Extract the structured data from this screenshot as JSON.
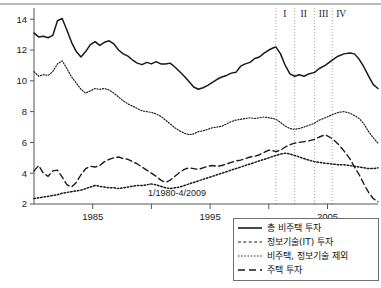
{
  "chart_data": {
    "type": "line",
    "title": "",
    "subtitle": "",
    "xlabel": "",
    "ylabel": "",
    "annotation": "1/1980-4/2009",
    "grid": false,
    "legend_position": "bottom-right",
    "xlim": [
      1980,
      2009.3
    ],
    "ylim": [
      2,
      14.6
    ],
    "x_ticks_major": [
      1985,
      1995,
      2005
    ],
    "x_ticks_minor": [
      1990,
      2000
    ],
    "x_tick_labels": [
      "1985",
      "1995",
      "2005"
    ],
    "y_ticks": [
      2,
      4,
      6,
      8,
      10,
      12,
      14
    ],
    "y_tick_labels": [
      "2",
      "4",
      "6",
      "8",
      "10",
      "12",
      "14"
    ],
    "period_markers": [
      {
        "label": "I",
        "x": 2000.6
      },
      {
        "label": "II",
        "x": 2002.2
      },
      {
        "label": "III",
        "x": 2003.9
      },
      {
        "label": "IV",
        "x": 2005.4
      }
    ],
    "series": [
      {
        "name": "총 비주택 투자",
        "style": "solid",
        "x": [
          1980.0,
          1980.4,
          1980.8,
          1981.2,
          1981.6,
          1982.0,
          1982.4,
          1982.8,
          1983.2,
          1983.6,
          1984.0,
          1984.4,
          1984.8,
          1985.2,
          1985.6,
          1986.0,
          1986.4,
          1986.8,
          1987.2,
          1987.6,
          1988.0,
          1988.4,
          1988.8,
          1989.2,
          1989.6,
          1990.0,
          1990.4,
          1990.8,
          1991.2,
          1991.6,
          1992.0,
          1992.4,
          1992.8,
          1993.2,
          1993.6,
          1994.0,
          1994.4,
          1994.8,
          1995.2,
          1995.6,
          1996.0,
          1996.4,
          1996.8,
          1997.2,
          1997.6,
          1998.0,
          1998.4,
          1998.8,
          1999.2,
          1999.6,
          2000.0,
          2000.4,
          2000.6,
          2001.0,
          2001.4,
          2001.8,
          2002.2,
          2002.6,
          2003.0,
          2003.4,
          2003.9,
          2004.3,
          2004.8,
          2005.4,
          2005.9,
          2006.4,
          2006.9,
          2007.3,
          2007.7,
          2008.1,
          2008.5,
          2008.9,
          2009.3
        ],
        "y": [
          13.1,
          12.85,
          12.9,
          12.8,
          12.95,
          13.9,
          14.05,
          13.3,
          12.5,
          11.9,
          11.55,
          11.9,
          12.35,
          12.55,
          12.3,
          12.5,
          12.6,
          12.4,
          12.0,
          11.75,
          11.6,
          11.35,
          11.15,
          11.05,
          11.2,
          11.1,
          11.25,
          11.1,
          11.1,
          11.15,
          10.9,
          10.6,
          10.3,
          9.95,
          9.6,
          9.45,
          9.55,
          9.7,
          9.9,
          10.1,
          10.25,
          10.35,
          10.5,
          10.55,
          10.95,
          11.1,
          11.2,
          11.45,
          11.55,
          11.8,
          12.0,
          12.15,
          12.2,
          11.75,
          11.0,
          10.45,
          10.3,
          10.4,
          10.3,
          10.45,
          10.55,
          10.8,
          11.0,
          11.35,
          11.6,
          11.75,
          11.8,
          11.75,
          11.4,
          10.9,
          10.3,
          9.75,
          9.5
        ]
      },
      {
        "name": "정보기술(IT) 투자",
        "style": "dotted-fine",
        "x": [
          1980.0,
          1980.4,
          1980.8,
          1981.2,
          1981.6,
          1982.0,
          1982.4,
          1982.8,
          1983.2,
          1983.6,
          1984.0,
          1984.4,
          1984.8,
          1985.2,
          1985.6,
          1986.0,
          1986.4,
          1986.8,
          1987.2,
          1987.6,
          1988.0,
          1988.4,
          1988.8,
          1989.2,
          1989.6,
          1990.0,
          1990.4,
          1990.8,
          1991.2,
          1991.6,
          1992.0,
          1992.4,
          1992.8,
          1993.2,
          1993.6,
          1994.0,
          1994.4,
          1994.8,
          1995.2,
          1995.6,
          1996.0,
          1996.4,
          1996.8,
          1997.2,
          1997.6,
          1998.0,
          1998.4,
          1998.8,
          1999.2,
          1999.6,
          2000.0,
          2000.4,
          2000.6,
          2001.0,
          2001.4,
          2001.8,
          2002.2,
          2002.6,
          2003.0,
          2003.4,
          2003.9,
          2004.3,
          2004.8,
          2005.4,
          2005.9,
          2006.4,
          2006.9,
          2007.3,
          2007.7,
          2008.1,
          2008.5,
          2008.9,
          2009.3
        ],
        "y": [
          10.6,
          10.3,
          10.4,
          10.35,
          10.6,
          11.1,
          11.3,
          10.8,
          10.25,
          9.85,
          9.45,
          9.2,
          9.35,
          9.5,
          9.45,
          9.5,
          9.4,
          9.2,
          8.95,
          8.7,
          8.5,
          8.35,
          8.2,
          8.05,
          8.0,
          7.95,
          7.85,
          7.7,
          7.45,
          7.2,
          6.95,
          6.75,
          6.6,
          6.5,
          6.55,
          6.7,
          6.75,
          6.85,
          6.95,
          7.0,
          7.05,
          7.2,
          7.35,
          7.45,
          7.5,
          7.55,
          7.6,
          7.55,
          7.6,
          7.65,
          7.6,
          7.55,
          7.5,
          7.3,
          7.05,
          6.9,
          6.85,
          6.9,
          7.0,
          7.1,
          7.25,
          7.45,
          7.6,
          7.8,
          7.95,
          8.0,
          7.9,
          7.75,
          7.55,
          7.2,
          6.7,
          6.3,
          5.95
        ]
      },
      {
        "name": "비주택, 정보기술 제외",
        "style": "dotted-bold",
        "x": [
          1980.0,
          1980.4,
          1980.8,
          1981.2,
          1981.6,
          1982.0,
          1982.4,
          1982.8,
          1983.2,
          1983.6,
          1984.0,
          1984.4,
          1984.8,
          1985.2,
          1985.6,
          1986.0,
          1986.4,
          1986.8,
          1987.2,
          1987.6,
          1988.0,
          1988.4,
          1988.8,
          1989.2,
          1989.6,
          1990.0,
          1990.4,
          1990.8,
          1991.2,
          1991.6,
          1992.0,
          1992.4,
          1992.8,
          1993.2,
          1993.6,
          1994.0,
          1994.4,
          1994.8,
          1995.2,
          1995.6,
          1996.0,
          1996.4,
          1996.8,
          1997.2,
          1997.6,
          1998.0,
          1998.4,
          1998.8,
          1999.2,
          1999.6,
          2000.0,
          2000.4,
          2000.6,
          2001.0,
          2001.4,
          2001.8,
          2002.2,
          2002.6,
          2003.0,
          2003.4,
          2003.9,
          2004.3,
          2004.8,
          2005.4,
          2005.9,
          2006.4,
          2006.9,
          2007.3,
          2007.7,
          2008.1,
          2008.5,
          2008.9,
          2009.3
        ],
        "y": [
          2.35,
          2.4,
          2.45,
          2.5,
          2.55,
          2.6,
          2.7,
          2.75,
          2.8,
          2.85,
          2.9,
          3.0,
          3.1,
          3.2,
          3.15,
          3.1,
          3.05,
          3.05,
          3.0,
          3.05,
          3.1,
          3.15,
          3.2,
          3.2,
          3.25,
          3.3,
          3.25,
          3.15,
          3.05,
          3.0,
          3.05,
          3.1,
          3.2,
          3.3,
          3.4,
          3.5,
          3.6,
          3.7,
          3.8,
          3.9,
          4.0,
          4.1,
          4.2,
          4.3,
          4.4,
          4.5,
          4.6,
          4.7,
          4.8,
          4.9,
          5.0,
          5.1,
          5.15,
          5.25,
          5.3,
          5.25,
          5.15,
          5.05,
          4.95,
          4.85,
          4.75,
          4.7,
          4.65,
          4.6,
          4.55,
          4.55,
          4.5,
          4.45,
          4.4,
          4.35,
          4.3,
          4.3,
          4.35
        ]
      },
      {
        "name": "주택 투자",
        "style": "dashed",
        "x": [
          1980.0,
          1980.4,
          1980.8,
          1981.2,
          1981.6,
          1982.0,
          1982.4,
          1982.8,
          1983.2,
          1983.6,
          1984.0,
          1984.4,
          1984.8,
          1985.2,
          1985.6,
          1986.0,
          1986.4,
          1986.8,
          1987.2,
          1987.6,
          1988.0,
          1988.4,
          1988.8,
          1989.2,
          1989.6,
          1990.0,
          1990.4,
          1990.8,
          1991.2,
          1991.6,
          1992.0,
          1992.4,
          1992.8,
          1993.2,
          1993.6,
          1994.0,
          1994.4,
          1994.8,
          1995.2,
          1995.6,
          1996.0,
          1996.4,
          1996.8,
          1997.2,
          1997.6,
          1998.0,
          1998.4,
          1998.8,
          1999.2,
          1999.6,
          2000.0,
          2000.4,
          2000.6,
          2001.0,
          2001.4,
          2001.8,
          2002.2,
          2002.6,
          2003.0,
          2003.4,
          2003.9,
          2004.3,
          2004.8,
          2005.4,
          2005.9,
          2006.4,
          2006.9,
          2007.3,
          2007.7,
          2008.1,
          2008.5,
          2008.9,
          2009.3
        ],
        "y": [
          4.15,
          4.5,
          4.0,
          3.8,
          4.15,
          4.2,
          3.75,
          3.25,
          3.1,
          3.4,
          3.9,
          4.3,
          4.45,
          4.4,
          4.5,
          4.75,
          4.9,
          5.0,
          5.05,
          4.95,
          4.9,
          4.75,
          4.6,
          4.4,
          4.2,
          4.0,
          3.8,
          3.55,
          3.4,
          3.55,
          3.8,
          4.05,
          4.25,
          4.35,
          4.3,
          4.25,
          4.35,
          4.45,
          4.5,
          4.45,
          4.5,
          4.6,
          4.7,
          4.8,
          4.85,
          4.95,
          5.05,
          5.1,
          5.2,
          5.35,
          5.5,
          5.45,
          5.4,
          5.5,
          5.7,
          5.85,
          5.95,
          6.0,
          6.05,
          6.1,
          6.2,
          6.35,
          6.5,
          6.25,
          5.9,
          5.45,
          4.95,
          4.4,
          3.9,
          3.3,
          2.75,
          2.35,
          2.15
        ]
      }
    ]
  },
  "annotation": {
    "text": "1/1980-4/2009"
  },
  "legend": {
    "items": [
      {
        "label": "총 비주택 투자",
        "style": "solid"
      },
      {
        "label": "정보기술(IT) 투자",
        "style": "dotted-fine"
      },
      {
        "label": "비주택, 정보기술 제외",
        "style": "dotted-bold"
      },
      {
        "label": "주택 투자",
        "style": "dashed"
      }
    ]
  },
  "colors": {
    "ink": "#1a1a1a",
    "axis": "#555555",
    "gridline": "#9a9a9a",
    "background": "#ffffff"
  }
}
